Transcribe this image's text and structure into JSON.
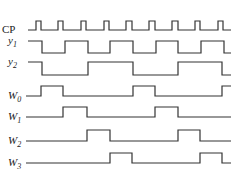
{
  "diagram": {
    "type": "timing-diagram",
    "x_start": 26,
    "x_end": 231,
    "signals": [
      {
        "name": "CP",
        "base": "CP",
        "sub": "",
        "label_y": 33,
        "high_y": 21,
        "low_y": 30,
        "x_start": 28,
        "points": [
          [
            28,
            0
          ],
          [
            36,
            1
          ],
          [
            41,
            0
          ],
          [
            58,
            1
          ],
          [
            63,
            0
          ],
          [
            81,
            1
          ],
          [
            86,
            0
          ],
          [
            104,
            1
          ],
          [
            109,
            0
          ],
          [
            126,
            1
          ],
          [
            132,
            0
          ],
          [
            149,
            1
          ],
          [
            155,
            0
          ],
          [
            172,
            1
          ],
          [
            178,
            0
          ],
          [
            195,
            1
          ],
          [
            200,
            0
          ],
          [
            218,
            1
          ],
          [
            223,
            0
          ]
        ]
      },
      {
        "name": "y1",
        "base": "y",
        "sub": "1",
        "label_y": 44,
        "high_y": 41,
        "low_y": 53,
        "x_start": 28,
        "points": [
          [
            28,
            1
          ],
          [
            42,
            0
          ],
          [
            65,
            1
          ],
          [
            88,
            0
          ],
          [
            110,
            1
          ],
          [
            133,
            0
          ],
          [
            156,
            1
          ],
          [
            178,
            0
          ],
          [
            201,
            1
          ],
          [
            224,
            0
          ]
        ]
      },
      {
        "name": "y2",
        "base": "y",
        "sub": "2",
        "label_y": 65,
        "high_y": 62,
        "low_y": 75,
        "x_start": 28,
        "points": [
          [
            28,
            1
          ],
          [
            42,
            0
          ],
          [
            88,
            1
          ],
          [
            133,
            0
          ],
          [
            178,
            1
          ],
          [
            222,
            0
          ]
        ]
      },
      {
        "name": "W0",
        "base": "W",
        "sub": "0",
        "label_y": 99,
        "high_y": 86,
        "low_y": 96,
        "x_start": 26,
        "points": [
          [
            26,
            0
          ],
          [
            41,
            1
          ],
          [
            63,
            0
          ],
          [
            133,
            1
          ],
          [
            155,
            0
          ],
          [
            222,
            1
          ]
        ]
      },
      {
        "name": "W1",
        "base": "W",
        "sub": "1",
        "label_y": 120,
        "high_y": 107,
        "low_y": 117,
        "x_start": 26,
        "points": [
          [
            26,
            0
          ],
          [
            63,
            1
          ],
          [
            87,
            0
          ],
          [
            155,
            1
          ],
          [
            178,
            0
          ]
        ]
      },
      {
        "name": "W2",
        "base": "W",
        "sub": "2",
        "label_y": 144,
        "high_y": 130,
        "low_y": 141,
        "x_start": 26,
        "points": [
          [
            26,
            0
          ],
          [
            87,
            1
          ],
          [
            110,
            0
          ],
          [
            178,
            1
          ],
          [
            200,
            0
          ]
        ]
      },
      {
        "name": "W3",
        "base": "W",
        "sub": "3",
        "label_y": 166,
        "high_y": 153,
        "low_y": 163,
        "x_start": 26,
        "points": [
          [
            26,
            0
          ],
          [
            110,
            1
          ],
          [
            132,
            0
          ],
          [
            200,
            1
          ],
          [
            222,
            0
          ]
        ]
      }
    ]
  }
}
